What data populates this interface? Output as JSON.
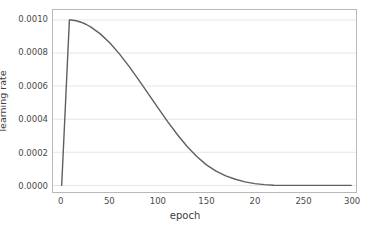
{
  "chart_data": {
    "type": "line",
    "title": "",
    "subtitle": "",
    "xlabel": "epoch",
    "ylabel": "learning rate",
    "xlim": [
      -9,
      305
    ],
    "ylim": [
      -4e-05,
      0.00106
    ],
    "xticks": [
      0,
      50,
      100,
      150,
      200,
      250,
      300
    ],
    "xtick_labels": [
      "0",
      "50",
      "100",
      "150",
      "20",
      "250",
      "300"
    ],
    "yticks": [
      0.0,
      0.0002,
      0.0004,
      0.0006,
      0.0008,
      0.001
    ],
    "ytick_labels": [
      "0.0000",
      "0.0002",
      "0.0004",
      "0.0006",
      "0.0008",
      "0.0010"
    ],
    "grid": "horizontal",
    "legend": "none",
    "line_color": "#5f5f5f",
    "grid_color": "#e6e6e6",
    "frame_color": "#b8b8b8",
    "background_color": "#ffffff",
    "series": [
      {
        "name": "learning rate",
        "x": [
          0,
          2,
          4,
          6,
          8,
          10,
          15,
          20,
          25,
          30,
          40,
          50,
          60,
          70,
          80,
          90,
          100,
          110,
          120,
          130,
          140,
          150,
          160,
          170,
          180,
          190,
          200,
          210,
          220,
          230,
          240,
          250,
          260,
          270,
          280,
          290,
          300
        ],
        "y": [
          0.0,
          0.00025,
          0.0005,
          0.00075,
          0.001,
          0.0009997,
          0.0009948,
          0.0009862,
          0.0009739,
          0.0009579,
          0.0009157,
          0.0008601,
          0.0007935,
          0.0007181,
          0.0006367,
          0.0005519,
          0.0004667,
          0.0003838,
          0.0003059,
          0.0002353,
          0.0001741,
          0.000124,
          8.62e-05,
          5.8e-05,
          3.69e-05,
          2.15e-05,
          1.09e-05,
          4.4e-06,
          1.1e-06,
          0.0,
          0.0,
          0.0,
          0.0,
          0.0,
          0.0,
          0.0,
          0.0
        ]
      }
    ],
    "annotations": {
      "peak_epoch": 8,
      "peak_value": 0.001,
      "warmup_epochs": 8,
      "total_epochs": 300,
      "schedule": "linear warmup then cosine decay"
    }
  }
}
